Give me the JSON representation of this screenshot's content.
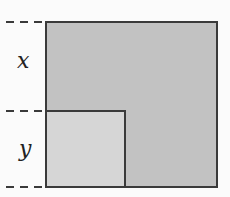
{
  "diagram": {
    "labels": {
      "x": "x",
      "y": "y"
    },
    "shapes": {
      "outer_square": {
        "fill": "#c2c2c2",
        "stroke": "#3a3a3a"
      },
      "inner_square": {
        "fill": "#d6d6d6",
        "stroke": "#3a3a3a"
      }
    },
    "dashed_markers": [
      "top",
      "middle",
      "bottom"
    ]
  }
}
